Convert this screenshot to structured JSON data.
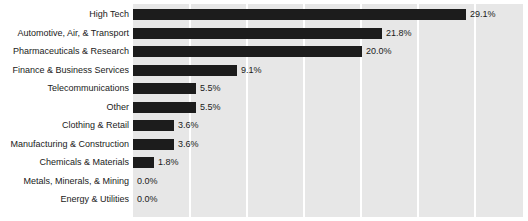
{
  "chart_data": {
    "type": "bar",
    "orientation": "horizontal",
    "title": "",
    "xlabel": "",
    "ylabel": "",
    "categories": [
      "High Tech",
      "Automotive, Air, & Transport",
      "Pharmaceuticals & Research",
      "Finance & Business Services",
      "Telecommunications",
      "Other",
      "Clothing & Retail",
      "Manufacturing & Construction",
      "Chemicals & Materials",
      "Metals, Minerals, & Mining",
      "Energy & Utilities"
    ],
    "values": [
      29.1,
      21.8,
      20.0,
      9.1,
      5.5,
      5.5,
      3.6,
      3.6,
      1.8,
      0.0,
      0.0
    ],
    "value_labels": [
      "29.1%",
      "21.8%",
      "20.0%",
      "9.1%",
      "5.5%",
      "5.5%",
      "3.6%",
      "3.6%",
      "1.8%",
      "0.0%",
      "0.0%"
    ],
    "xlim": [
      0,
      34.1
    ],
    "gridlines_at": [
      5,
      10,
      15,
      20,
      25,
      30
    ],
    "grid": true,
    "legend": false,
    "bar_color": "#1c1c1c",
    "plot_background": "#e7e7e7",
    "page_background": "#ffffff"
  }
}
